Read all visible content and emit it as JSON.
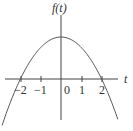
{
  "chart_data": {
    "type": "line",
    "title": "",
    "xlabel": "t",
    "ylabel": "f(t)",
    "x_ticks": [
      -2,
      -1,
      0,
      1,
      2
    ],
    "x_tick_labels": [
      "−2",
      "−1",
      "0",
      "1",
      "2"
    ],
    "series": [
      {
        "name": "f(t)",
        "description": "downward-opening parabola with roots at t = -2 and t = 2, maximum at t = 0",
        "x": [
          -2.8,
          -2.4,
          -2,
          -1.5,
          -1,
          -0.5,
          0,
          0.5,
          1,
          1.5,
          2,
          2.4,
          2.8
        ],
        "y_relative": [
          -0.96,
          -0.44,
          0,
          0.4375,
          0.75,
          0.9375,
          1,
          0.9375,
          0.75,
          0.4375,
          0,
          -0.44,
          -0.96
        ]
      }
    ],
    "roots": [
      -2,
      2
    ],
    "vertex_t": 0,
    "xlim": [
      -2.9,
      2.8
    ],
    "grid": false,
    "legend": "none"
  },
  "labels": {
    "y_axis": "f(t)",
    "x_axis": "t",
    "ticks": [
      "−2",
      "−1",
      "0",
      "1",
      "2"
    ]
  }
}
